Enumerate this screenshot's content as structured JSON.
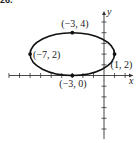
{
  "problem_number": "26.",
  "chart_data": {
    "type": "scatter",
    "title": "",
    "xlabel": "x",
    "ylabel": "y",
    "shape": "ellipse",
    "ellipse": {
      "center": [
        -3,
        2
      ],
      "semi_major_horizontal": 4,
      "semi_minor_vertical": 2
    },
    "points": [
      {
        "x": -3,
        "y": 4,
        "label": "(−3, 4)"
      },
      {
        "x": -7,
        "y": 2,
        "label": "(−7, 2)"
      },
      {
        "x": 1,
        "y": 2,
        "label": "(1, 2)"
      },
      {
        "x": -3,
        "y": 0,
        "label": "(−3, 0)"
      }
    ],
    "xlim": [
      -9,
      3
    ],
    "ylim": [
      -6,
      6
    ],
    "tick_spacing": 1,
    "grid": false,
    "legend": null
  }
}
